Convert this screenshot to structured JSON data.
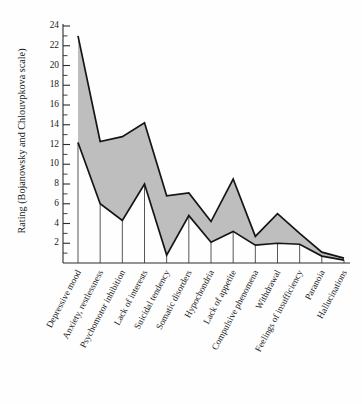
{
  "chart_data": {
    "type": "area",
    "title": "",
    "xlabel": "",
    "ylabel": "Rating (Bojanowsky and Chlouvpkova scale)",
    "ylim": [
      0,
      25
    ],
    "ytick_step": 2,
    "yticks": [
      2,
      4,
      6,
      8,
      10,
      12,
      14,
      16,
      18,
      20,
      22,
      24
    ],
    "minor_ticks": true,
    "grid": false,
    "legend": "none",
    "categories": [
      "Depressive mood",
      "Anxiety, restlessness",
      "Psychomotor inhibition",
      "Lack of interests",
      "Suicidal tendency",
      "Somatic disorders",
      "Hypochondria",
      "Lack of appetite",
      "Compulsive phenomena",
      "Withdrawal",
      "Feelings of insufficiency",
      "Paranoia",
      "Hallucinations"
    ],
    "series": [
      {
        "name": "Upper bound",
        "values": [
          23.0,
          12.3,
          12.8,
          14.2,
          6.8,
          7.1,
          4.2,
          8.5,
          2.7,
          5.0,
          3.0,
          1.1,
          0.5
        ]
      },
      {
        "name": "Lower bound",
        "values": [
          12.2,
          6.0,
          4.3,
          8.0,
          0.8,
          4.8,
          2.1,
          3.2,
          1.8,
          2.0,
          1.9,
          0.7,
          0.3
        ]
      }
    ],
    "band_fill_color": "#b9b9b9",
    "band_edge_color": "#151515",
    "axis_color": "#2b2b2b"
  }
}
